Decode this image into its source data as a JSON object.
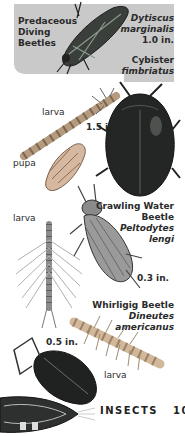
{
  "page": {
    "section": "INSECTS",
    "page_number": "105"
  },
  "header_box": {
    "group_title_lines": [
      "Predaceous",
      "Diving",
      "Beetles"
    ],
    "background": "#c9c9c9"
  },
  "species": [
    {
      "id": "dytiscus",
      "scientific_lines": [
        "Dytiscus",
        "marginalis"
      ],
      "size": "1.0 in."
    },
    {
      "id": "cybister",
      "scientific_lines": [
        "Cybister",
        "fimbriatus"
      ],
      "size": "1.5 in."
    },
    {
      "id": "peltodytes",
      "common_lines": [
        "Crawling Water",
        "Beetle"
      ],
      "scientific_lines": [
        "Peltodytes",
        "lengi"
      ],
      "size": "0.3 in."
    },
    {
      "id": "dineutes",
      "common_lines": [
        "Whirligig Beetle"
      ],
      "scientific_lines": [
        "Dineutes",
        "americanus"
      ],
      "size": "0.5 in."
    }
  ],
  "stage_labels": {
    "larva_1": "larva",
    "pupa": "pupa",
    "larva_2": "larva",
    "larva_3": "larva"
  },
  "illustrations": [
    "dytiscus-adult-icon",
    "dytiscus-larva-icon",
    "pupa-icon",
    "cybister-adult-icon",
    "peltodytes-larva-icon",
    "peltodytes-adult-icon",
    "whirligig-larva-icon",
    "whirligig-adult-icon",
    "whirligig-swimming-icon"
  ]
}
